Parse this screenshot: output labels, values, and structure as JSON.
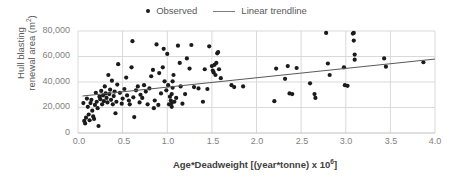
{
  "legend": {
    "position": "top-center",
    "entries": [
      {
        "label": "Observed",
        "marker": "dot",
        "color": "#1a1a1a"
      },
      {
        "label": "Linear trendline",
        "marker": "line",
        "color": "#7f7f7f"
      }
    ]
  },
  "axis": {
    "y_title_line1": "Hull blasting",
    "y_title_line2_pre": "renewal area (m",
    "y_title_line2_sup": "2",
    "y_title_line2_post": ")",
    "x_title_pre": "Age*Deadweight [(year*tonne) x 10",
    "x_title_sup": "6",
    "x_title_post": "]",
    "y_ticks": [
      "0",
      "20,000",
      "40,000",
      "60,000",
      "80,000"
    ],
    "x_ticks": [
      "0.0",
      "0.5",
      "1.0",
      "1.5",
      "2.0",
      "2.5",
      "3.0",
      "3.5",
      "4.0"
    ]
  },
  "colors": {
    "marker": "#1a1a1a",
    "trendline": "#595959",
    "gridline": "#d9d9d9",
    "axis_text": "#7f7f7f",
    "title_text": "#404040",
    "background": "#ffffff"
  },
  "chart_data": {
    "type": "scatter",
    "title": "",
    "xlabel": "Age*Deadweight [(year*tonne) x 10^6]",
    "ylabel": "Hull blasting renewal area (m^2)",
    "xlim": [
      0.0,
      4.0
    ],
    "ylim": [
      0,
      80000
    ],
    "xticks": [
      0.0,
      0.5,
      1.0,
      1.5,
      2.0,
      2.5,
      3.0,
      3.5,
      4.0
    ],
    "yticks": [
      0,
      20000,
      40000,
      60000,
      80000
    ],
    "grid": true,
    "legend_position": "top-center",
    "series": [
      {
        "name": "Observed",
        "type": "scatter",
        "marker": "dot",
        "color": "#1a1a1a",
        "points": [
          [
            0.06,
            23500
          ],
          [
            0.07,
            9500
          ],
          [
            0.08,
            7500
          ],
          [
            0.09,
            12000
          ],
          [
            0.1,
            27000
          ],
          [
            0.11,
            20500
          ],
          [
            0.12,
            14500
          ],
          [
            0.13,
            10000
          ],
          [
            0.14,
            23500
          ],
          [
            0.15,
            26000
          ],
          [
            0.16,
            17500
          ],
          [
            0.17,
            13000
          ],
          [
            0.18,
            11000
          ],
          [
            0.19,
            22000
          ],
          [
            0.2,
            31500
          ],
          [
            0.21,
            24500
          ],
          [
            0.22,
            19500
          ],
          [
            0.23,
            5500
          ],
          [
            0.24,
            28500
          ],
          [
            0.25,
            26500
          ],
          [
            0.26,
            33000
          ],
          [
            0.27,
            22500
          ],
          [
            0.28,
            29500
          ],
          [
            0.29,
            25000
          ],
          [
            0.3,
            36500
          ],
          [
            0.31,
            31000
          ],
          [
            0.32,
            27500
          ],
          [
            0.33,
            24000
          ],
          [
            0.34,
            45500
          ],
          [
            0.35,
            30500
          ],
          [
            0.36,
            34000
          ],
          [
            0.37,
            26000
          ],
          [
            0.38,
            41000
          ],
          [
            0.39,
            22500
          ],
          [
            0.4,
            29000
          ],
          [
            0.41,
            32500
          ],
          [
            0.42,
            15500
          ],
          [
            0.43,
            24500
          ],
          [
            0.44,
            38000
          ],
          [
            0.45,
            54000
          ],
          [
            0.47,
            31500
          ],
          [
            0.49,
            23000
          ],
          [
            0.5,
            27000
          ],
          [
            0.52,
            34500
          ],
          [
            0.54,
            43500
          ],
          [
            0.55,
            29500
          ],
          [
            0.57,
            25500
          ],
          [
            0.58,
            22500
          ],
          [
            0.6,
            51500
          ],
          [
            0.61,
            72000
          ],
          [
            0.62,
            28000
          ],
          [
            0.63,
            12500
          ],
          [
            0.65,
            33500
          ],
          [
            0.67,
            36500
          ],
          [
            0.69,
            24000
          ],
          [
            0.7,
            30000
          ],
          [
            0.72,
            27500
          ],
          [
            0.74,
            37500
          ],
          [
            0.76,
            32500
          ],
          [
            0.78,
            22500
          ],
          [
            0.8,
            35000
          ],
          [
            0.82,
            44500
          ],
          [
            0.84,
            49500
          ],
          [
            0.85,
            19500
          ],
          [
            0.86,
            25500
          ],
          [
            0.88,
            69500
          ],
          [
            0.9,
            22000
          ],
          [
            0.91,
            47000
          ],
          [
            0.93,
            31000
          ],
          [
            0.95,
            51500
          ],
          [
            0.96,
            66000
          ],
          [
            0.97,
            40500
          ],
          [
            0.99,
            33500
          ],
          [
            1.0,
            62000
          ],
          [
            1.01,
            37500
          ],
          [
            1.02,
            22500
          ],
          [
            1.03,
            28500
          ],
          [
            1.04,
            25500
          ],
          [
            1.05,
            20500
          ],
          [
            1.05,
            23500
          ],
          [
            1.05,
            30500
          ],
          [
            1.06,
            35500
          ],
          [
            1.06,
            40500
          ],
          [
            1.07,
            45500
          ],
          [
            1.08,
            24500
          ],
          [
            1.1,
            27500
          ],
          [
            1.12,
            68500
          ],
          [
            1.14,
            55000
          ],
          [
            1.15,
            36500
          ],
          [
            1.17,
            23000
          ],
          [
            1.2,
            30500
          ],
          [
            1.22,
            58500
          ],
          [
            1.25,
            50500
          ],
          [
            1.27,
            69000
          ],
          [
            1.3,
            36000
          ],
          [
            1.35,
            35000
          ],
          [
            1.4,
            24500
          ],
          [
            1.42,
            50000
          ],
          [
            1.45,
            34500
          ],
          [
            1.47,
            68000
          ],
          [
            1.5,
            52500
          ],
          [
            1.51,
            49000
          ],
          [
            1.52,
            47500
          ],
          [
            1.53,
            53500
          ],
          [
            1.54,
            45500
          ],
          [
            1.55,
            55000
          ],
          [
            1.56,
            62500
          ],
          [
            1.57,
            63500
          ],
          [
            1.58,
            50000
          ],
          [
            1.6,
            43000
          ],
          [
            1.72,
            37500
          ],
          [
            1.75,
            36000
          ],
          [
            1.85,
            36500
          ],
          [
            2.2,
            25000
          ],
          [
            2.22,
            50500
          ],
          [
            2.32,
            42500
          ],
          [
            2.35,
            52500
          ],
          [
            2.37,
            31000
          ],
          [
            2.4,
            30500
          ],
          [
            2.45,
            51000
          ],
          [
            2.6,
            39000
          ],
          [
            2.65,
            30500
          ],
          [
            2.66,
            27500
          ],
          [
            2.78,
            78500
          ],
          [
            2.8,
            54500
          ],
          [
            2.82,
            45500
          ],
          [
            2.98,
            51500
          ],
          [
            2.99,
            37500
          ],
          [
            3.02,
            37000
          ],
          [
            3.08,
            78000
          ],
          [
            3.09,
            78500
          ],
          [
            3.09,
            72500
          ],
          [
            3.1,
            61500
          ],
          [
            3.1,
            57500
          ],
          [
            3.43,
            58500
          ],
          [
            3.45,
            52000
          ],
          [
            3.87,
            55500
          ]
        ]
      },
      {
        "name": "Linear trendline",
        "type": "line",
        "color": "#595959",
        "equation_endpoints": [
          [
            0.05,
            29000
          ],
          [
            4.0,
            58000
          ]
        ]
      }
    ]
  }
}
